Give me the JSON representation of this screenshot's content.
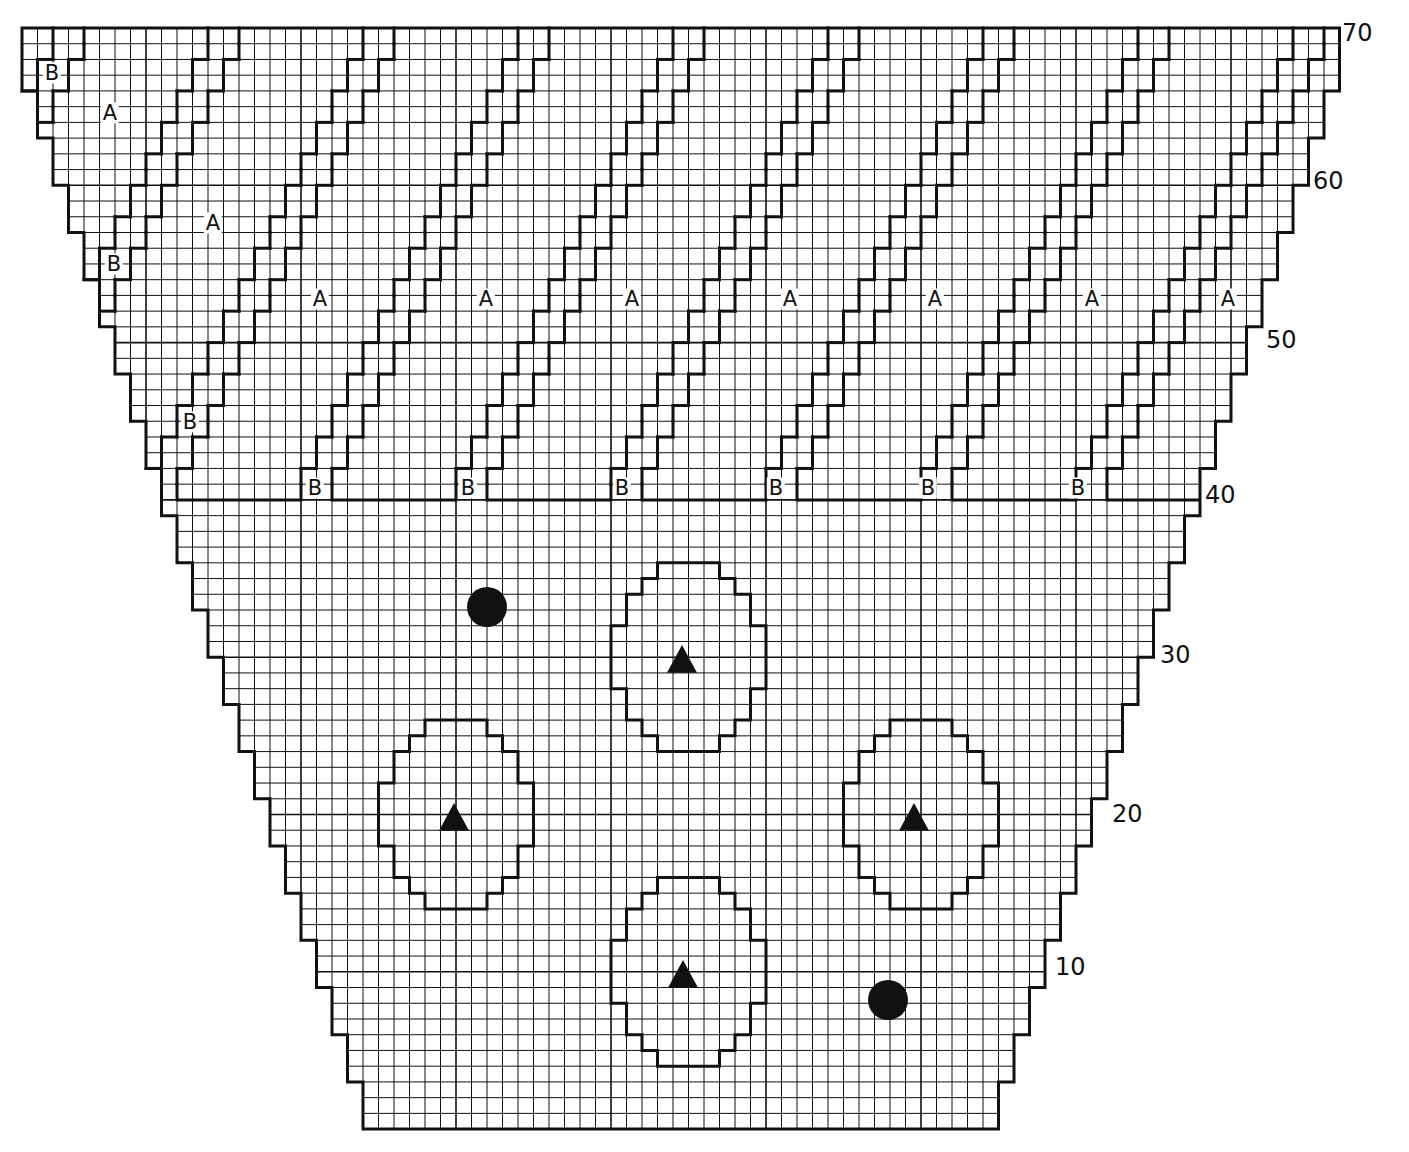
{
  "diagram": {
    "type": "knitting-chart",
    "ink_color": "#111111",
    "paper_color": "#ffffff",
    "grid": {
      "columns": 85,
      "rows": 70,
      "origin_x": 22,
      "origin_y": 28,
      "cell_width": 15.5,
      "cell_height": 15.73,
      "major_every": 10
    },
    "row_numbers": [
      {
        "label": "70",
        "x": 1342,
        "y": 33
      },
      {
        "label": "60",
        "x": 1313,
        "y": 181
      },
      {
        "label": "50",
        "x": 1266,
        "y": 340
      },
      {
        "label": "40",
        "x": 1205,
        "y": 495
      },
      {
        "label": "30",
        "x": 1160,
        "y": 655
      },
      {
        "label": "20",
        "x": 1112,
        "y": 814
      },
      {
        "label": "10",
        "x": 1055,
        "y": 967
      }
    ],
    "stripe_band_boundary_row": 40,
    "stripes": [
      {
        "base_col": -12
      },
      {
        "base_col": -2
      },
      {
        "base_col": 8
      },
      {
        "base_col": 18
      },
      {
        "base_col": 28
      },
      {
        "base_col": 38
      },
      {
        "base_col": 48
      },
      {
        "base_col": 58
      },
      {
        "base_col": 68
      }
    ],
    "labels_a": [
      {
        "text": "A",
        "x": 110,
        "y": 113
      },
      {
        "text": "A",
        "x": 213,
        "y": 223
      },
      {
        "text": "A",
        "x": 320,
        "y": 299
      },
      {
        "text": "A",
        "x": 486,
        "y": 299
      },
      {
        "text": "A",
        "x": 632,
        "y": 299
      },
      {
        "text": "A",
        "x": 790,
        "y": 299
      },
      {
        "text": "A",
        "x": 935,
        "y": 299
      },
      {
        "text": "A",
        "x": 1092,
        "y": 299
      },
      {
        "text": "A",
        "x": 1228,
        "y": 299
      }
    ],
    "labels_b": [
      {
        "text": "B",
        "x": 52,
        "y": 73
      },
      {
        "text": "B",
        "x": 114,
        "y": 264
      },
      {
        "text": "B",
        "x": 190,
        "y": 422
      },
      {
        "text": "B",
        "x": 315,
        "y": 488
      },
      {
        "text": "B",
        "x": 468,
        "y": 488
      },
      {
        "text": "B",
        "x": 622,
        "y": 488
      },
      {
        "text": "B",
        "x": 776,
        "y": 488
      },
      {
        "text": "B",
        "x": 928,
        "y": 488
      },
      {
        "text": "B",
        "x": 1078,
        "y": 488
      }
    ],
    "motifs": [
      {
        "name": "motif-top-center",
        "col": 38,
        "top_row_index": 34,
        "symbol": "triangle",
        "symbol_x": 682,
        "symbol_y": 660
      },
      {
        "name": "motif-left",
        "col": 23,
        "top_row_index": 44,
        "symbol": "triangle",
        "symbol_x": 454,
        "symbol_y": 818
      },
      {
        "name": "motif-right",
        "col": 53,
        "top_row_index": 44,
        "symbol": "triangle",
        "symbol_x": 914,
        "symbol_y": 818
      },
      {
        "name": "motif-bottom-center",
        "col": 38,
        "top_row_index": 54,
        "symbol": "triangle",
        "symbol_x": 683,
        "symbol_y": 975
      }
    ],
    "motif_shape_rows": [
      [
        3,
        6
      ],
      [
        2,
        7
      ],
      [
        1,
        8
      ],
      [
        1,
        8
      ],
      [
        0,
        9
      ],
      [
        0,
        9
      ],
      [
        0,
        9
      ],
      [
        0,
        9
      ],
      [
        1,
        8
      ],
      [
        1,
        8
      ],
      [
        2,
        7
      ],
      [
        3,
        6
      ]
    ],
    "dots": [
      {
        "x": 487,
        "y": 607,
        "r": 20
      },
      {
        "x": 888,
        "y": 1000,
        "r": 20
      }
    ],
    "symbols": {
      "triangle": "▲",
      "dot": "●"
    }
  }
}
